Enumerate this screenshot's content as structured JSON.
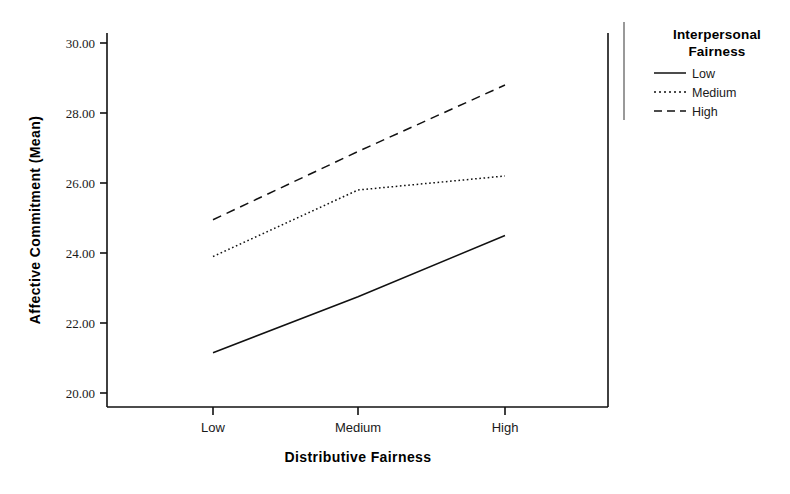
{
  "chart_data": {
    "type": "line",
    "title": "",
    "subtitle": "",
    "xlabel": "Distributive Fairness",
    "ylabel": "Affective Commitment (Mean)",
    "categories": [
      "Low",
      "Medium",
      "High"
    ],
    "xtick_labels": [
      "Low",
      "Medium",
      "High"
    ],
    "ytick_labels": [
      "20.00",
      "22.00",
      "24.00",
      "26.00",
      "28.00",
      "30.00"
    ],
    "ytick_values": [
      20,
      22,
      24,
      26,
      28,
      30
    ],
    "ylim": [
      19.4,
      30.6
    ],
    "grid": false,
    "legend_position": "right",
    "legend_title": "Interpersonal Fairness",
    "series": [
      {
        "name": "Low",
        "style": "solid",
        "values": [
          21.15,
          22.75,
          24.5
        ]
      },
      {
        "name": "Medium",
        "style": "dotted",
        "values": [
          23.9,
          25.8,
          26.2
        ]
      },
      {
        "name": "High",
        "style": "dashed",
        "values": [
          24.95,
          26.9,
          28.8
        ]
      }
    ]
  },
  "legend": {
    "title_line_1": "Interpersonal",
    "title_line_2": "Fairness",
    "items": [
      {
        "label": "Low",
        "style": "solid"
      },
      {
        "label": "Medium",
        "style": "dotted"
      },
      {
        "label": "High",
        "style": "dashed"
      }
    ]
  },
  "axes": {
    "x_title": "Distributive Fairness",
    "y_title": "Affective Commitment (Mean)",
    "x_ticks": [
      "Low",
      "Medium",
      "High"
    ],
    "y_ticks": [
      "30.00",
      "28.00",
      "26.00",
      "24.00",
      "22.00",
      "20.00"
    ]
  },
  "colors": {
    "line": "#111111",
    "text": "#1a1a1a",
    "background": "#ffffff"
  }
}
